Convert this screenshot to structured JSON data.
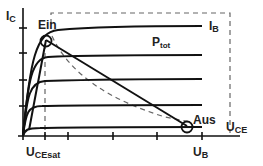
{
  "diagram": {
    "type": "transistor-output-characteristic",
    "labels": {
      "y_axis": "I",
      "y_axis_sub": "C",
      "x_axis": "U",
      "x_axis_sub": "CE",
      "base_current": "I",
      "base_current_sub": "B",
      "power": "P",
      "power_sub": "tot",
      "on_point": "Ein",
      "off_point": "Aus",
      "sat_voltage": "U",
      "sat_voltage_sub": "CEsat",
      "supply_voltage": "U",
      "supply_voltage_sub": "B"
    },
    "curves_count": 5,
    "colors": {
      "line": "#1a1a1a",
      "dashed": "#555555",
      "background": "#ffffff"
    }
  }
}
